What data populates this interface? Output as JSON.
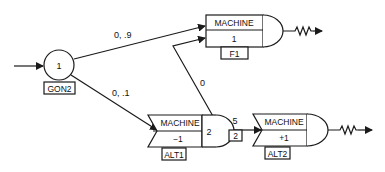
{
  "diagram": {
    "colors": {
      "stroke": "#1a1a1a",
      "background": "#ffffff"
    },
    "start_node": {
      "number": "1",
      "label": "GON2"
    },
    "edges": {
      "to_f1": "0, .9",
      "to_alt1": "0, .1",
      "feedback": "0",
      "alt1_to_alt2": "5",
      "alt1_to_alt2_box": "2"
    },
    "machines": [
      {
        "id": "F1",
        "title": "MACHINE",
        "value": "1",
        "label": "F1"
      },
      {
        "id": "ALT1",
        "title": "MACHINE",
        "value": "−1",
        "number": "2",
        "label": "ALT1"
      },
      {
        "id": "ALT2",
        "title": "MACHINE",
        "value": "+1",
        "label": "ALT2"
      }
    ]
  }
}
